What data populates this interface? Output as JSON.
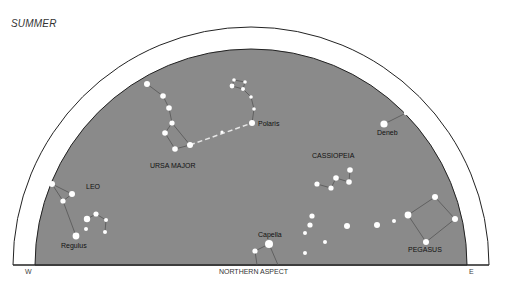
{
  "title": "SUMMER",
  "footer": {
    "west": "W",
    "east": "E",
    "aspect": "NORTHERN ASPECT"
  },
  "colors": {
    "sky": "#8a8a8a",
    "ring": "#ffffff",
    "outline": "#222222",
    "star": "#ffffff",
    "line": "#555555",
    "pointer": "#e6e6e6"
  },
  "constellations": [
    {
      "name": "URSA MAJOR",
      "label_pos": [
        150,
        168
      ]
    },
    {
      "name": "CASSIOPEIA",
      "label_pos": [
        312,
        158
      ]
    },
    {
      "name": "LEO",
      "label_pos": [
        86,
        189
      ]
    },
    {
      "name": "PEGASUS",
      "label_pos": [
        408,
        252
      ]
    }
  ],
  "stars_named": [
    {
      "name": "Polaris",
      "label_pos": [
        258,
        126
      ]
    },
    {
      "name": "Deneb",
      "label_pos": [
        377,
        135
      ]
    },
    {
      "name": "Regulus",
      "label_pos": [
        61,
        248
      ]
    },
    {
      "name": "Capella",
      "label_pos": [
        258,
        237
      ]
    }
  ]
}
